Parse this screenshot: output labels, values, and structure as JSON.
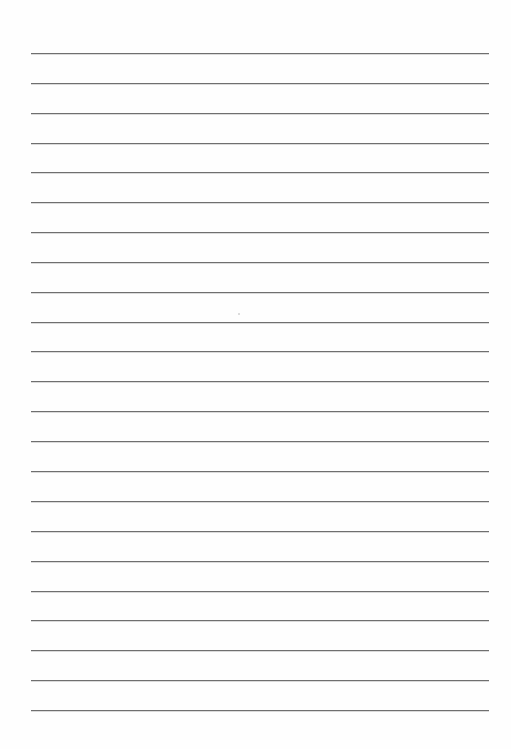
{
  "document": {
    "type": "lined-paper",
    "background_color": "#fefefe",
    "rule_color": "#6f6f6f",
    "rule_count": 23,
    "rules_y": [
      53,
      83,
      113,
      143,
      172,
      202,
      232,
      262,
      292,
      322,
      351,
      381,
      411,
      441,
      471,
      501,
      531,
      561,
      591,
      620,
      650,
      680,
      710
    ],
    "text": []
  }
}
